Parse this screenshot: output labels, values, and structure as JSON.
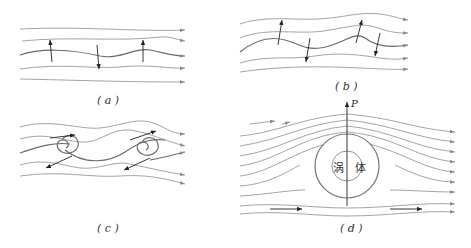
{
  "figure": {
    "panels": [
      {
        "id": "a",
        "caption": "( a )",
        "description": "nearly parallel streamlines with small wave disturbance and alternating vertical arrows"
      },
      {
        "id": "b",
        "caption": "( b )",
        "description": "amplified wavy streamlines with inclined arrows"
      },
      {
        "id": "c",
        "caption": "( c )",
        "description": "streamlines rolling up into spiral vortices with paired arrows"
      },
      {
        "id": "d",
        "caption": "( d )",
        "description": "flow around a vortex body with lift force P"
      }
    ],
    "panel_d": {
      "vortex_label": "涡 体",
      "force_label": "P"
    },
    "colors": {
      "streamline": "#9a9a9a",
      "main_streamline": "#6a6a6a",
      "arrow": "#222222",
      "background": "#ffffff"
    }
  }
}
